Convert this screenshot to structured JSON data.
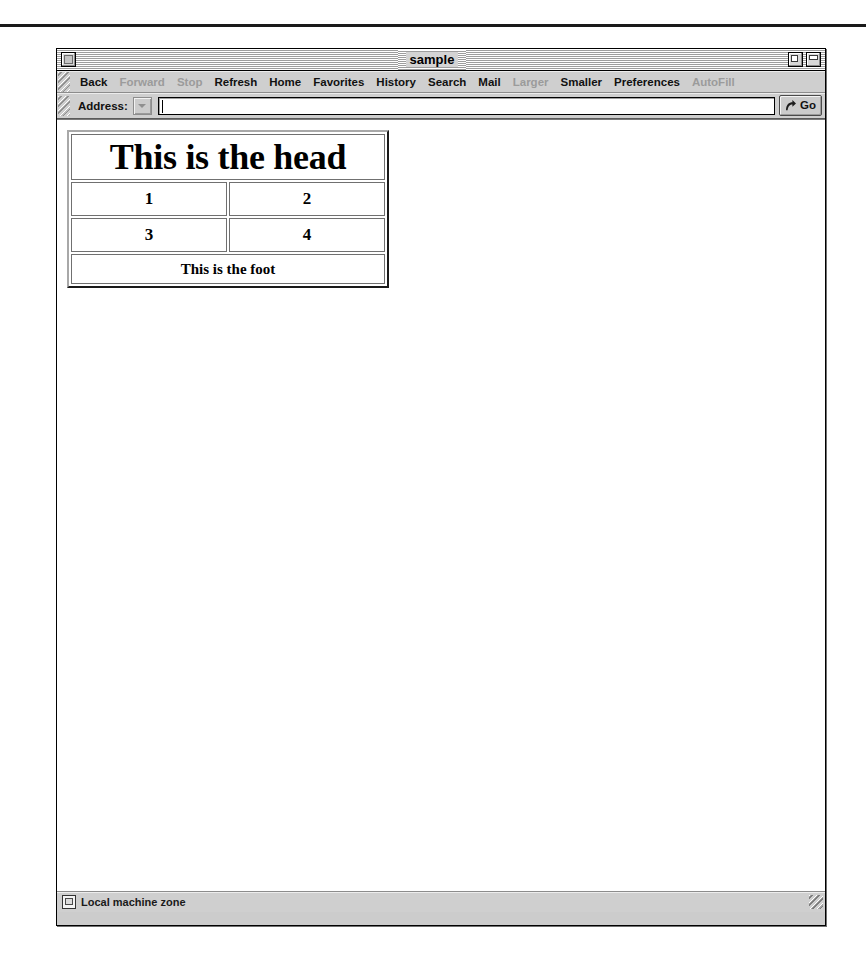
{
  "window": {
    "title": "sample",
    "close_box": "close-box",
    "zoom_box": "zoom-box",
    "collapse_box": "collapse-box"
  },
  "toolbar": {
    "items": [
      {
        "label": "Back",
        "enabled": true
      },
      {
        "label": "Forward",
        "enabled": false
      },
      {
        "label": "Stop",
        "enabled": false
      },
      {
        "label": "Refresh",
        "enabled": true
      },
      {
        "label": "Home",
        "enabled": true
      },
      {
        "label": "Favorites",
        "enabled": true
      },
      {
        "label": "History",
        "enabled": true
      },
      {
        "label": "Search",
        "enabled": true
      },
      {
        "label": "Mail",
        "enabled": true
      },
      {
        "label": "Larger",
        "enabled": false
      },
      {
        "label": "Smaller",
        "enabled": true
      },
      {
        "label": "Preferences",
        "enabled": true
      },
      {
        "label": "AutoFill",
        "enabled": false
      }
    ]
  },
  "address_bar": {
    "label": "Address:",
    "value": "",
    "placeholder": "",
    "dropdown_icon": "chevron-down-icon",
    "go_label": "Go",
    "go_icon": "curved-arrow-icon"
  },
  "page": {
    "table": {
      "head": {
        "text": "This is the head",
        "colspan": 2
      },
      "body_rows": [
        [
          "1",
          "2"
        ],
        [
          "3",
          "4"
        ]
      ],
      "foot": {
        "text": "This is the foot",
        "colspan": 2
      }
    }
  },
  "status_bar": {
    "zone_icon": "computer-zone-icon",
    "zone_text": "Local machine zone",
    "resize_grip": "resize-grip"
  },
  "colors": {
    "window_chrome": "#cfcfcf",
    "page_background": "#ffffff",
    "text": "#000000",
    "disabled_text": "#9b9b9b",
    "border": "#707070"
  }
}
